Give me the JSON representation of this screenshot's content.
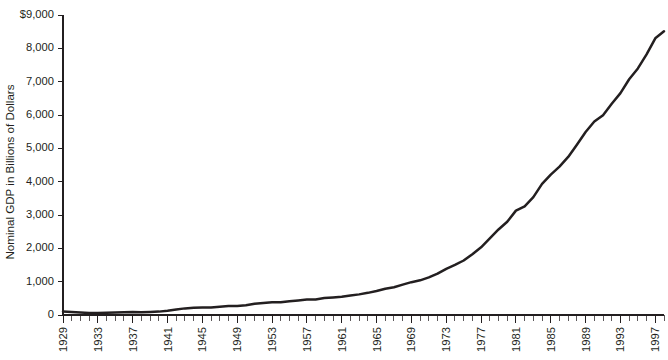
{
  "chart_data": {
    "type": "line",
    "title": "",
    "xlabel": "",
    "ylabel": "Nominal GDP in Billions of Dollars",
    "ylim": [
      0,
      9000
    ],
    "xlim": [
      1929,
      1998
    ],
    "grid": false,
    "legend": null,
    "y_tick_labels": [
      "$9,000",
      "8,000",
      "7,000",
      "6,000",
      "5,000",
      "4,000",
      "3,000",
      "2,000",
      "1,000",
      "0"
    ],
    "y_tick_values": [
      9000,
      8000,
      7000,
      6000,
      5000,
      4000,
      3000,
      2000,
      1000,
      0
    ],
    "x_tick_labels": [
      "1929",
      "1933",
      "1937",
      "1941",
      "1945",
      "1949",
      "1953",
      "1957",
      "1961",
      "1965",
      "1969",
      "1973",
      "1977",
      "1981",
      "1985",
      "1989",
      "1993",
      "1997"
    ],
    "x_tick_values": [
      1929,
      1933,
      1937,
      1941,
      1945,
      1949,
      1953,
      1957,
      1961,
      1965,
      1969,
      1973,
      1977,
      1981,
      1985,
      1989,
      1993,
      1997
    ],
    "x_minor_step": 1,
    "line_color": "#231f20",
    "series": [
      {
        "name": "Nominal GDP",
        "x": [
          1929,
          1930,
          1931,
          1932,
          1933,
          1934,
          1935,
          1936,
          1937,
          1938,
          1939,
          1940,
          1941,
          1942,
          1943,
          1944,
          1945,
          1946,
          1947,
          1948,
          1949,
          1950,
          1951,
          1952,
          1953,
          1954,
          1955,
          1956,
          1957,
          1958,
          1959,
          1960,
          1961,
          1962,
          1963,
          1964,
          1965,
          1966,
          1967,
          1968,
          1969,
          1970,
          1971,
          1972,
          1973,
          1974,
          1975,
          1976,
          1977,
          1978,
          1979,
          1980,
          1981,
          1982,
          1983,
          1984,
          1985,
          1986,
          1987,
          1988,
          1989,
          1990,
          1991,
          1992,
          1993,
          1994,
          1995,
          1996,
          1997,
          1998
        ],
        "values": [
          103.6,
          91.2,
          76.5,
          58.7,
          56.4,
          66.0,
          73.3,
          83.8,
          91.9,
          86.1,
          92.2,
          101.4,
          126.7,
          161.9,
          198.6,
          219.8,
          223.1,
          222.3,
          244.4,
          269.6,
          267.7,
          294.3,
          339.5,
          358.6,
          379.9,
          381.1,
          415.2,
          438.0,
          461.5,
          467.9,
          507.4,
          527.4,
          545.7,
          586.5,
          618.7,
          664.4,
          720.1,
          789.3,
          834.1,
          911.5,
          985.3,
          1039.7,
          1128.6,
          1240.4,
          1385.5,
          1501.0,
          1635.2,
          1823.9,
          2031.4,
          2295.9,
          2566.4,
          2795.6,
          3131.3,
          3259.2,
          3534.9,
          3932.7,
          4213.0,
          4452.9,
          4742.5,
          5108.3,
          5489.1,
          5803.2,
          5995.9,
          6337.7,
          6657.4,
          7072.2,
          7397.7,
          7816.9,
          8300.8,
          8511.0
        ]
      }
    ]
  },
  "geometry": {
    "plot_left": 63,
    "plot_right": 664,
    "plot_top": 15,
    "plot_bottom": 315
  }
}
